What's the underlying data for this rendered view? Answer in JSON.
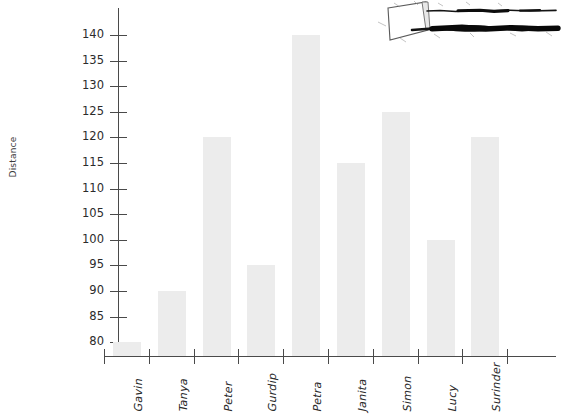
{
  "chart_data": {
    "type": "bar",
    "title": "",
    "xlabel": "",
    "ylabel": "Distance",
    "categories": [
      "Gavin",
      "Tanya",
      "Peter",
      "Gurdip",
      "Petra",
      "Janita",
      "Simon",
      "Lucy",
      "Surinder"
    ],
    "values": [
      80,
      90,
      120,
      95,
      140,
      115,
      125,
      100,
      120
    ],
    "ylim": [
      77,
      142
    ],
    "yticks": [
      80,
      85,
      90,
      95,
      100,
      105,
      110,
      115,
      120,
      125,
      130,
      135,
      140
    ],
    "ytick_labels": [
      "80",
      "85",
      "90",
      "95",
      "100",
      "105",
      "110",
      "115",
      "120",
      "125",
      "130",
      "135",
      "140"
    ],
    "grid": false,
    "legend": false,
    "bar_color": "#ececec",
    "axis_color": "#4a4a4a",
    "text_color": "#2b2b2b"
  },
  "annotations": {
    "artifact_label": "ink-smudge-scan-artifact"
  }
}
